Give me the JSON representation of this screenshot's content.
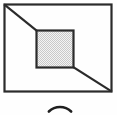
{
  "figure": {
    "background_color": "#fefefe",
    "stroke_color": "#2b2b2b",
    "fill_pattern_color": "#c9c9c9",
    "fill_base_color": "#f2f2f2",
    "outer_rectangle": {
      "name": "outer-frame",
      "x": 4.5,
      "y": 4.5,
      "width": 107,
      "height": 87,
      "stroke_width": 2.2,
      "fill": "none"
    },
    "inner_square": {
      "name": "inner-panel",
      "x": 36.5,
      "y": 30.5,
      "width": 37,
      "height": 37,
      "stroke_width": 2.2,
      "fill": "checker-pattern"
    },
    "diagonals": [
      {
        "name": "diagonal-top-left",
        "x1": 5,
        "y1": 5,
        "x2": 37,
        "y2": 31,
        "stroke_width": 2.2
      },
      {
        "name": "diagonal-bottom-right",
        "x1": 73,
        "y1": 67,
        "x2": 111,
        "y2": 91,
        "stroke_width": 2.2
      }
    ],
    "arc_below": {
      "name": "circle-top-arc",
      "center_x": 60,
      "center_y": 123,
      "radius": 16,
      "stroke_width": 2.6,
      "description": "top edge of a circle cropped at the bottom of the frame"
    }
  },
  "labels": {
    "alt_text": "Rectangle with a shaded square inside, diagonal lines from the top-left and bottom-right corners, and the top of a circle below"
  }
}
